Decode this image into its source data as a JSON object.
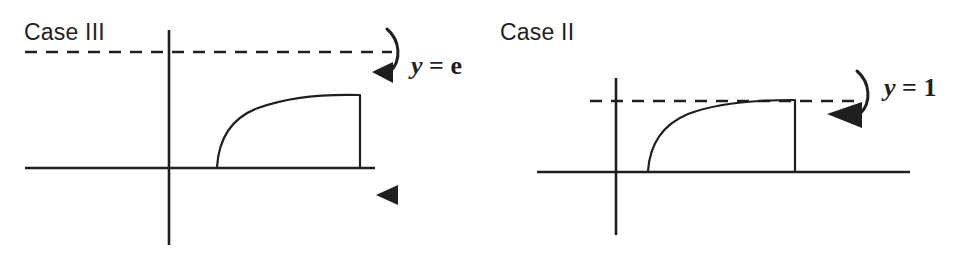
{
  "figure": {
    "background_color": "#ffffff",
    "ink_color": "#1f1f1f",
    "panels": [
      {
        "id": "case-3",
        "title": "Case III",
        "axis_label": {
          "variable": "y",
          "relation": "=",
          "value": "e"
        },
        "asymptote_line_label": "y = e",
        "description": "Region under curve y = ln x style arc from x=1 to x=e, rotated about the horizontal line y = e",
        "dashed_line": {
          "y": 52,
          "x_start": 25,
          "x_end": 392
        },
        "x_axis": {
          "y": 168,
          "x_start": 25,
          "x_end": 375
        },
        "y_axis": {
          "x": 169,
          "y_start": 30,
          "y_end": 245
        },
        "curve": {
          "start_x": 217,
          "start_y": 167,
          "end_x": 360,
          "end_y": 96
        },
        "right_edge": {
          "x": 360,
          "y_top": 96,
          "y_bottom": 168
        },
        "rotation_arc": {
          "top_x": 392,
          "top_y": 30,
          "arrow_x": 383,
          "arrow_y": 73
        },
        "extra_arrowhead": {
          "x": 388,
          "y": 194,
          "direction": "left"
        }
      },
      {
        "id": "case-2",
        "title": "Case II",
        "axis_label": {
          "variable": "y",
          "relation": "=",
          "value": "1"
        },
        "asymptote_line_label": "y = 1",
        "description": "Region under curve from x=1 to x=e, rotated about the horizontal line y = 1 which touches the top of the region",
        "dashed_line": {
          "y": 101,
          "x_start": 590,
          "x_end": 856
        },
        "x_axis": {
          "y": 172,
          "x_start": 537,
          "x_end": 910
        },
        "y_axis": {
          "x": 616,
          "y_start": 78,
          "y_end": 235
        },
        "curve": {
          "start_x": 648,
          "start_y": 171,
          "end_x": 795,
          "end_y": 101
        },
        "right_edge": {
          "x": 795,
          "y_top": 101,
          "y_bottom": 172
        },
        "rotation_arc": {
          "top_x": 862,
          "top_y": 72,
          "arrow_x": 853,
          "arrow_y": 115
        }
      }
    ]
  }
}
